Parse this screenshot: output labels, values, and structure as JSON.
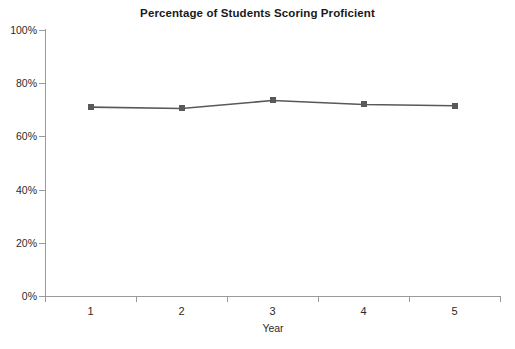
{
  "chart_data": {
    "type": "line",
    "title": "Percentage of Students Scoring Proficient",
    "xlabel": "Year",
    "ylabel": "",
    "categories": [
      "1",
      "2",
      "3",
      "4",
      "5"
    ],
    "values": [
      71,
      70.5,
      73.5,
      72,
      71.5
    ],
    "series": [
      {
        "name": "Percentage of Students Scoring Proficient",
        "values": [
          71,
          70.5,
          73.5,
          72,
          71.5
        ]
      }
    ],
    "ylim": [
      0,
      100
    ],
    "ytick_labels": [
      "0%",
      "20%",
      "40%",
      "60%",
      "80%",
      "100%"
    ],
    "ytick_values": [
      0,
      20,
      40,
      60,
      80,
      100
    ],
    "xtick_labels": [
      "1",
      "2",
      "3",
      "4",
      "5"
    ],
    "grid": false,
    "legend": false,
    "legend_position": "none",
    "marker": "square",
    "line_color": "#595959",
    "marker_color": "#595959",
    "axis_color": "#9a9a9a",
    "background_color": "#ffffff"
  }
}
